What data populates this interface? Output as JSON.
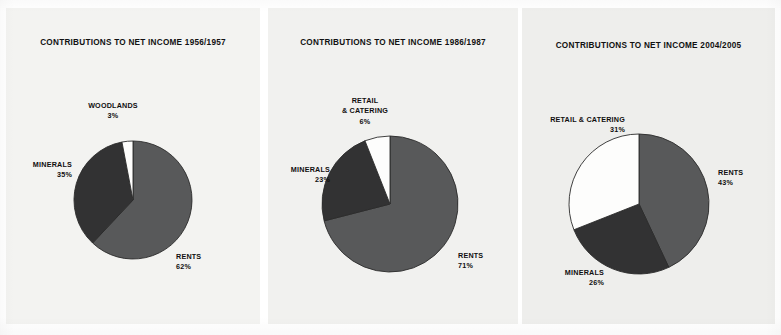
{
  "figure": {
    "background_color": "#ffffff",
    "panel_color": "#f2f2f0"
  },
  "palette": {
    "rents_color": "#58595a",
    "minerals_color": "#323233",
    "retail_color": "#fdfdfc",
    "woodlands_color": "#fdfdfc",
    "outline_color": "#2b2b2b",
    "text_color": "#100f0f"
  },
  "chart_data": [
    {
      "type": "pie",
      "title": "CONTRIBUTIONS TO NET INCOME 1956/1957",
      "categories": [
        "RENTS",
        "MINERALS",
        "WOODLANDS"
      ],
      "values": [
        62,
        35,
        3
      ],
      "value_labels": [
        "62%",
        "35%",
        "3%"
      ],
      "colors": [
        "#58595a",
        "#323233",
        "#fdfdfc"
      ],
      "start_angle_deg": 0,
      "direction": "clockwise",
      "labels": [
        {
          "name": "RENTS",
          "lines": [
            "RENTS"
          ],
          "pct": "62%",
          "position": "right"
        },
        {
          "name": "MINERALS",
          "lines": [
            "MINERALS"
          ],
          "pct": "35%",
          "position": "left"
        },
        {
          "name": "WOODLANDS",
          "lines": [
            "WOODLANDS"
          ],
          "pct": "3%",
          "position": "top"
        }
      ]
    },
    {
      "type": "pie",
      "title": "CONTRIBUTIONS TO NET INCOME 1986/1987",
      "categories": [
        "RENTS",
        "MINERALS",
        "RETAIL & CATERING"
      ],
      "values": [
        71,
        23,
        6
      ],
      "value_labels": [
        "71%",
        "23%",
        "6%"
      ],
      "colors": [
        "#58595a",
        "#323233",
        "#fdfdfc"
      ],
      "start_angle_deg": 0,
      "direction": "clockwise",
      "labels": [
        {
          "name": "RENTS",
          "lines": [
            "RENTS"
          ],
          "pct": "71%",
          "position": "right"
        },
        {
          "name": "MINERALS",
          "lines": [
            "MINERALS"
          ],
          "pct": "23%",
          "position": "left"
        },
        {
          "name": "RETAIL & CATERING",
          "lines": [
            "RETAIL",
            "& CATERING"
          ],
          "pct": "6%",
          "position": "top"
        }
      ]
    },
    {
      "type": "pie",
      "title": "CONTRIBUTIONS TO NET INCOME 2004/2005",
      "categories": [
        "RENTS",
        "MINERALS",
        "RETAIL & CATERING"
      ],
      "values": [
        43,
        26,
        31
      ],
      "value_labels": [
        "43%",
        "26%",
        "31%"
      ],
      "colors": [
        "#58595a",
        "#323233",
        "#fdfdfc"
      ],
      "start_angle_deg": 0,
      "direction": "clockwise",
      "labels": [
        {
          "name": "RENTS",
          "lines": [
            "RENTS"
          ],
          "pct": "43%",
          "position": "right"
        },
        {
          "name": "MINERALS",
          "lines": [
            "MINERALS"
          ],
          "pct": "26%",
          "position": "bottom-left"
        },
        {
          "name": "RETAIL & CATERING",
          "lines": [
            "RETAIL & CATERING"
          ],
          "pct": "31%",
          "position": "top-left"
        }
      ]
    }
  ],
  "panels": [
    {
      "title": "CONTRIBUTIONS TO NET INCOME 1956/1957",
      "geometry": {
        "cx": 127,
        "cy": 192,
        "r": 59,
        "title_top": 30
      },
      "label_positions": [
        {
          "left": 170,
          "top": 244,
          "align": "lbl-right"
        },
        {
          "left": 8,
          "top": 152,
          "align": "lbl-left",
          "width": 58
        },
        {
          "left": 72,
          "top": 93,
          "align": "lbl-center",
          "width": 70
        }
      ]
    },
    {
      "title": "CONTRIBUTIONS TO NET INCOME 1986/1987",
      "geometry": {
        "cx": 122,
        "cy": 196,
        "r": 68,
        "title_top": 30
      },
      "label_positions": [
        {
          "left": 190,
          "top": 243,
          "align": "lbl-right"
        },
        {
          "left": 4,
          "top": 157,
          "align": "lbl-left",
          "width": 58
        },
        {
          "left": 62,
          "top": 88,
          "align": "lbl-center",
          "width": 70
        }
      ]
    },
    {
      "title": "CONTRIBUTIONS TO NET INCOME 2004/2005",
      "geometry": {
        "cx": 117,
        "cy": 196,
        "r": 70,
        "title_top": 33
      },
      "label_positions": [
        {
          "left": 196,
          "top": 160,
          "align": "lbl-right"
        },
        {
          "left": 6,
          "top": 260,
          "align": "lbl-left",
          "width": 76
        },
        {
          "left": 3,
          "top": 107,
          "align": "lbl-left",
          "width": 100
        }
      ]
    }
  ]
}
